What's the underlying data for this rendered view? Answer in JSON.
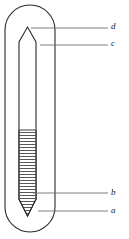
{
  "figure": {
    "view": "cross-section",
    "line_color": "#2b2b2b",
    "leader_color": "#6f6f6f",
    "hatch_color": "#3a3a3a",
    "fill_color": "#ffffff",
    "background_color": "#ffffff",
    "canvas": {
      "width": 129,
      "height": 239
    }
  },
  "labels": [
    {
      "key": "d",
      "text": "d",
      "target": "inner-tube-upper-tip",
      "leader_start": {
        "x": 31,
        "y": 28
      },
      "leader_end": {
        "x": 108,
        "y": 28
      }
    },
    {
      "key": "c",
      "text": "c",
      "target": "inner-tube-wall",
      "leader_start": {
        "x": 40,
        "y": 45
      },
      "leader_end": {
        "x": 108,
        "y": 45
      }
    },
    {
      "key": "b",
      "text": "b",
      "target": "hatched-column",
      "leader_start": {
        "x": 33,
        "y": 193
      },
      "leader_end": {
        "x": 108,
        "y": 193
      }
    },
    {
      "key": "a",
      "text": "a",
      "target": "inner-tube-lower-tip",
      "leader_start": {
        "x": 38,
        "y": 211
      },
      "leader_end": {
        "x": 108,
        "y": 211
      }
    }
  ],
  "geometry": {
    "outer_tube": {
      "name": "outer-jacket",
      "left_x": 5,
      "right_x": 55,
      "top_y": 5,
      "bottom_y": 232,
      "corner_radius": 25,
      "stroke_width": 1.1
    },
    "inner_tube": {
      "name": "inner-capillary",
      "left_x": 19,
      "right_x": 36,
      "tip_top_y": 27,
      "shoulder_top_y": 42,
      "shoulder_bottom_y": 199,
      "tip_bottom_y": 216,
      "stroke_width": 1.1
    },
    "hatched_fill": {
      "name": "liquid-column",
      "top_y": 130,
      "bottom_y": 199,
      "tip_bottom_y": 207,
      "hatch_spacing_px": 3,
      "hatch_line_width": 0.8
    }
  }
}
